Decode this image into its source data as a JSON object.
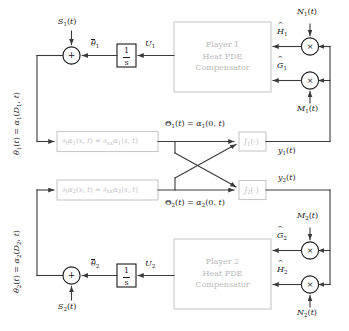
{
  "diagram": {
    "colors": {
      "line": "#3a3a3a",
      "text": "#1a1a1a",
      "grey_box_border": "#c9c9c9",
      "grey_box_text": "#bdbdbd",
      "background": "#ffffff"
    }
  },
  "player1": {
    "compensator_box": {
      "line1": "Player 1",
      "line2": "Heat PDE",
      "line3": "Compensator"
    },
    "pde_box": "∂ₜα₁(x,t) = ∂ₓₓα₁(x,t)",
    "pde_box_parts": {
      "lhs_op": "∂",
      "lhs_sub": "t",
      "lhs_var": "α",
      "lhs_var_sub": "1",
      "lhs_args": "(x, t)",
      "equals": "=",
      "rhs_op": "∂",
      "rhs_sub": "xx",
      "rhs_var": "α",
      "rhs_var_sub": "1",
      "rhs_args": "(x, t)"
    },
    "cost_block": "J₁(·)",
    "integrator_numerator": "1",
    "integrator_denominator": "s",
    "sum_sign": "+",
    "signals": {
      "control": "U₁",
      "theta_bar": "θ̄₁",
      "state_output": "θ₁(t) = α₁(D₁,t)",
      "boundary": "Θ₁(t) = α₁(0,t)",
      "measurement": "y₁(t)",
      "dither_sum": "S₁(t)",
      "demod_gradient": "Ĝ₁",
      "demod_hessian": "Ĥ₁",
      "mod_hessian": "N₁(t)",
      "mod_gradient": "M₁(t)"
    },
    "multiplier_symbol": "×"
  },
  "player2": {
    "compensator_box": {
      "line1": "Player 2",
      "line2": "Heat PDE",
      "line3": "Compensator"
    },
    "pde_box": "∂ₜα₂(x,t) = ∂ₓₓα₂(x,t)",
    "pde_box_parts": {
      "lhs_op": "∂",
      "lhs_sub": "t",
      "lhs_var": "α",
      "lhs_var_sub": "2",
      "lhs_args": "(x, t)",
      "equals": "=",
      "rhs_op": "∂",
      "rhs_sub": "xx",
      "rhs_var": "α",
      "rhs_var_sub": "2",
      "rhs_args": "(x, t)"
    },
    "cost_block": "J₂(·)",
    "integrator_numerator": "1",
    "integrator_denominator": "s",
    "sum_sign": "+",
    "signals": {
      "control": "U₂",
      "theta_bar": "θ̄₂",
      "state_output": "θ₂(t) = α₂(D₂,t)",
      "boundary": "Θ₂(t) = α₂(0,t)",
      "measurement": "y₂(t)",
      "dither_sum": "S₂(t)",
      "demod_gradient": "Ĝ₂",
      "demod_hessian": "Ĥ₂",
      "mod_gradient": "M₂(t)",
      "mod_hessian": "N₂(t)"
    },
    "multiplier_symbol": "×"
  }
}
